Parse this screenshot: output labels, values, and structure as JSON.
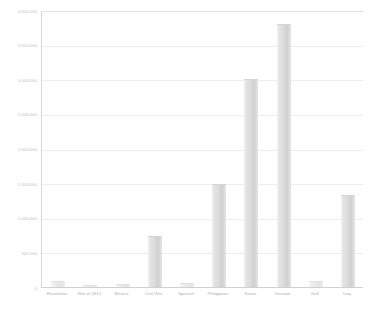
{
  "chart_data": {
    "type": "bar",
    "title": "",
    "xlabel": "",
    "ylabel": "",
    "categories": [
      "Revolution",
      "War of 1812",
      "Mexico",
      "Civil War",
      "Spanish",
      "Philippines",
      "Korea",
      "Vietnam",
      "Gulf",
      "Iraq"
    ],
    "values": [
      80000,
      35000,
      40000,
      740000,
      60000,
      1490000,
      3000000,
      3800000,
      90000,
      1330000
    ],
    "ylim": [
      0,
      4000000
    ],
    "ytick_values": [
      0,
      500000,
      1000000,
      1500000,
      2000000,
      2500000,
      3000000,
      3500000,
      4000000
    ],
    "ytick_labels": [
      "0",
      "500,000",
      "1,000,000",
      "1,500,000",
      "2,000,000",
      "2,500,000",
      "3,000,000",
      "3,500,000",
      "4,000,000"
    ],
    "grid": true,
    "legend": false,
    "legend_position": "none",
    "bar_color": "#dcdcdc",
    "gridline_color": "#ececec",
    "axis_color": "#d0d0d0",
    "label_color": "#b5b5b5",
    "background_color": "#ffffff"
  }
}
